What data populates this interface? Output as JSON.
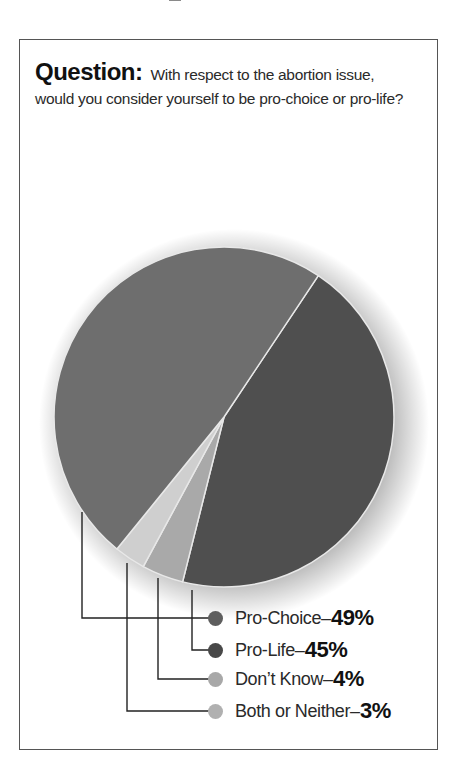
{
  "header": {
    "question_label": "Question:",
    "question_text": "With respect to the abortion issue, would you consider yourself to be pro-choice or pro-life?"
  },
  "chart_data": {
    "type": "pie",
    "title": "Question: With respect to the abortion issue, would you consider yourself to be pro-choice or pro-life?",
    "categories": [
      "Pro-Choice",
      "Pro-Life",
      "Don't Know",
      "Both or Neither"
    ],
    "values": [
      49,
      45,
      4,
      3
    ],
    "unit": "%",
    "colors": [
      "#6e6e6e",
      "#4f4f4f",
      "#a9a9a9",
      "#cfcfcf"
    ],
    "start_angle_deg": 33.7,
    "order_clockwise": [
      "Pro-Life",
      "Don't Know",
      "Both or Neither",
      "Pro-Choice"
    ],
    "legend_position": "bottom-right with leader lines"
  },
  "legend": {
    "separator": "–",
    "items": [
      {
        "label": "Pro-Choice",
        "value": "49%",
        "dot_color": "#5e5e5e"
      },
      {
        "label": "Pro-Life",
        "value": "45%",
        "dot_color": "#484848"
      },
      {
        "label": "Don’t Know",
        "value": "4%",
        "dot_color": "#a8a8a8"
      },
      {
        "label": "Both or Neither",
        "value": "3%",
        "dot_color": "#b0b0b0"
      }
    ]
  }
}
